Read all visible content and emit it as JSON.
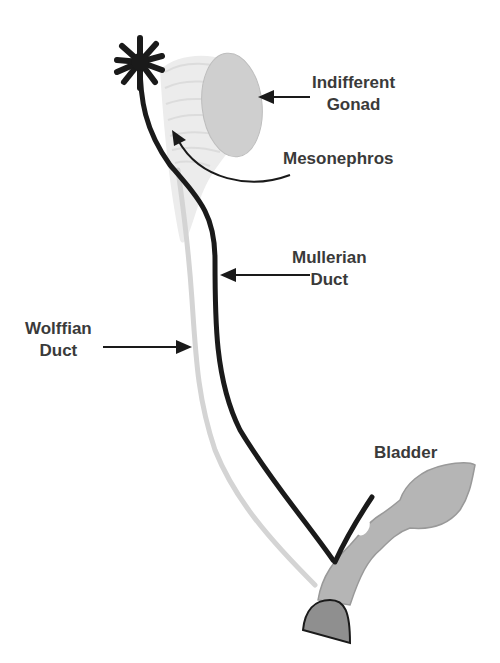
{
  "diagram": {
    "labels": {
      "indifferent_gonad": {
        "line1": "Indifferent",
        "line2": "Gonad"
      },
      "mesonephros": {
        "line1": "Mesonephros"
      },
      "mullerian_duct": {
        "line1": "Mullerian",
        "line2": "Duct"
      },
      "wolffian_duct": {
        "line1": "Wolffian",
        "line2": "Duct"
      },
      "bladder": {
        "line1": "Bladder"
      }
    },
    "colors": {
      "mullerian_duct": "#1a1a1a",
      "wolffian_duct": "#d4d4d4",
      "gonad": "#cfcfcf",
      "mesonephros": "#e6e6e6",
      "bladder": "#b5b5b5",
      "urethra_cap": "#8f8f8f",
      "text": "#3a3a3a"
    }
  }
}
